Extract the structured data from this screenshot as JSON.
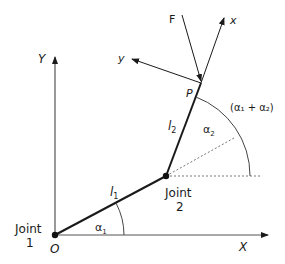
{
  "diagram": {
    "axes": {
      "x_label": "X",
      "y_label": "Y",
      "origin_label": "O"
    },
    "joints": [
      {
        "line1": "Joint",
        "line2": "1"
      },
      {
        "line1": "Joint",
        "line2": "2"
      }
    ],
    "links": {
      "l1": "l",
      "l1_sub": "1",
      "l2": "l",
      "l2_sub": "2"
    },
    "angles": {
      "a1": "α",
      "a1_sub": "1",
      "a2": "α",
      "a2_sub": "2",
      "sum": "(α₁ + α₂)"
    },
    "end_point": "P",
    "force": "F",
    "local_axes": {
      "x": "x",
      "y": "y"
    }
  }
}
